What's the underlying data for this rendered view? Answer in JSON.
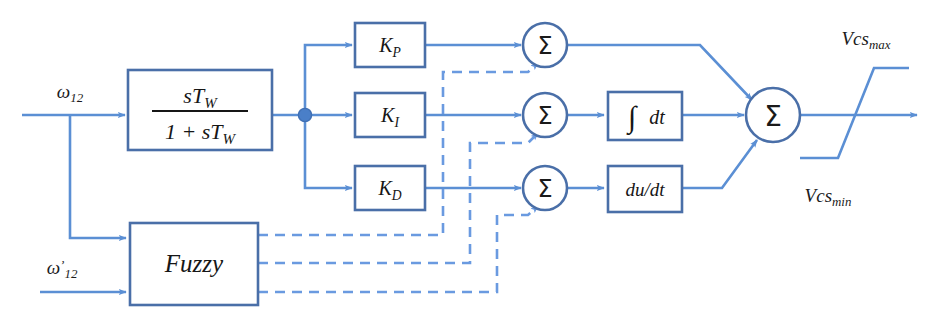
{
  "diagram": {
    "type": "control-block-diagram",
    "colors": {
      "line": "#5b8fd4",
      "block_border": "#4a6fa8",
      "dashed_line": "#6a9ae0",
      "text": "#161616",
      "background": "#ffffff"
    }
  },
  "inputs": {
    "omega": {
      "base": "ω",
      "sub": "12",
      "prime": ""
    },
    "omega_prime": {
      "base": "ω",
      "sub": "12",
      "prime": "’"
    }
  },
  "blocks": {
    "washout": {
      "numerator": "sT",
      "numerator_sub": "W",
      "denominator_pre": "1 + sT",
      "denominator_sub": "W"
    },
    "kp": {
      "base": "K",
      "sub": "P"
    },
    "ki": {
      "base": "K",
      "sub": "I"
    },
    "kd": {
      "base": "K",
      "sub": "D"
    },
    "integrator": {
      "symbol": "∫",
      "label": "dt"
    },
    "derivative": {
      "label": "du/dt"
    },
    "fuzzy": {
      "label": "Fuzzy"
    }
  },
  "summers": {
    "sum_p": "Σ",
    "sum_i": "Σ",
    "sum_d": "Σ",
    "sum_out": "Σ"
  },
  "limiter": {
    "max_label": {
      "base": "Vcs",
      "sub": "max"
    },
    "min_label": {
      "base": "Vcs",
      "sub": "min"
    }
  }
}
